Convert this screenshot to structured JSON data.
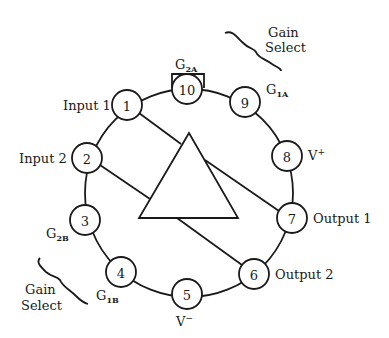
{
  "diagram": {
    "type": "pinout",
    "colors": {
      "ink": "#1a1a1a",
      "background": "#ffffff"
    },
    "pins": [
      {
        "number": "1",
        "label": "Input 1"
      },
      {
        "number": "2",
        "label": "Input 2"
      },
      {
        "number": "3",
        "label_main": "G",
        "label_sub": "2B"
      },
      {
        "number": "4",
        "label_main": "G",
        "label_sub": "1B"
      },
      {
        "number": "5",
        "label_main": "V",
        "label_sup": "−"
      },
      {
        "number": "6",
        "label": "Output 2"
      },
      {
        "number": "7",
        "label": "Output 1"
      },
      {
        "number": "8",
        "label_main": "V",
        "label_sup": "+"
      },
      {
        "number": "9",
        "label_main": "G",
        "label_sub": "1A"
      },
      {
        "number": "10",
        "label_main": "G",
        "label_sub": "2A"
      }
    ],
    "annotations": {
      "gain_select_top": {
        "line1": "Gain",
        "line2": "Select"
      },
      "gain_select_bottom": {
        "line1": "Gain",
        "line2": "Select"
      }
    }
  }
}
